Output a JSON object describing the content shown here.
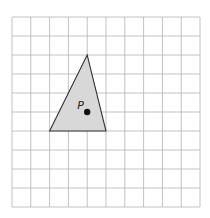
{
  "figure": {
    "grid": {
      "columns": 10,
      "rows": 10,
      "origin_px": [
        12,
        17
      ],
      "cell_px": [
        18.8,
        19
      ],
      "line_color": "#b3b3b3"
    },
    "triangle": {
      "vertices_grid": [
        [
          4,
          2
        ],
        [
          2,
          6
        ],
        [
          5,
          6
        ]
      ],
      "fill": "#d8d8d8",
      "stroke": "#333333"
    },
    "point": {
      "label": "P",
      "position_grid": [
        4,
        5
      ],
      "color": "#111111"
    }
  }
}
